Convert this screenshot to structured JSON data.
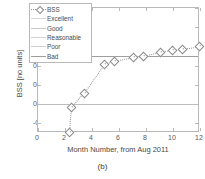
{
  "caption": "(b)",
  "axes": {
    "xlabel": "Month Number, from Aug 2011",
    "ylabel": "BSS [no units]",
    "xticks": [
      "0",
      "2",
      "4",
      "6",
      "8",
      "10",
      "12"
    ],
    "yticks": [
      "1",
      "0.8",
      "0.6",
      "0.4",
      "0.2",
      "0",
      "-0.2"
    ]
  },
  "legend": {
    "items": [
      {
        "label": "BSS",
        "style": "dotted-diamond",
        "color": "#9a9a9a"
      },
      {
        "label": "Excellent",
        "style": "solid",
        "color": "#d8d8d8"
      },
      {
        "label": "Good",
        "style": "solid",
        "color": "#c9c9c9"
      },
      {
        "label": "Reasonable",
        "style": "solid",
        "color": "#d2d2d2"
      },
      {
        "label": "Poor",
        "style": "solid",
        "color": "#cfcfcf"
      },
      {
        "label": "Bad",
        "style": "solid",
        "color": "#9e9e9e"
      }
    ]
  },
  "chart_data": {
    "type": "line",
    "title": "",
    "xlabel": "Month Number, from Aug 2011",
    "ylabel": "BSS [no units]",
    "xlim": [
      0,
      12
    ],
    "ylim": [
      -0.3,
      1
    ],
    "xticks": [
      0,
      2,
      4,
      6,
      8,
      10,
      12
    ],
    "yticks": [
      -0.2,
      0,
      0.2,
      0.4,
      0.6,
      0.8,
      1
    ],
    "grid": false,
    "legend_position": "upper-left",
    "series": [
      {
        "name": "BSS",
        "marker": "diamond",
        "linestyle": "dotted",
        "x": [
          2.3,
          2.45,
          3.4,
          4.9,
          5.6,
          7.0,
          7.8,
          9.0,
          9.9,
          10.7,
          11.9
        ],
        "y": [
          -0.29,
          -0.03,
          0.12,
          0.42,
          0.45,
          0.49,
          0.5,
          0.54,
          0.565,
          0.575,
          0.6
        ]
      }
    ],
    "reference_lines": [
      {
        "label": "zero",
        "y": 0.0,
        "orientation": "horizontal",
        "color": "#bdbdbd"
      },
      {
        "label": "Bad",
        "y": 0.5,
        "orientation": "horizontal",
        "color": "#9e9e9e"
      }
    ],
    "annotations": [
      "(b)"
    ]
  }
}
